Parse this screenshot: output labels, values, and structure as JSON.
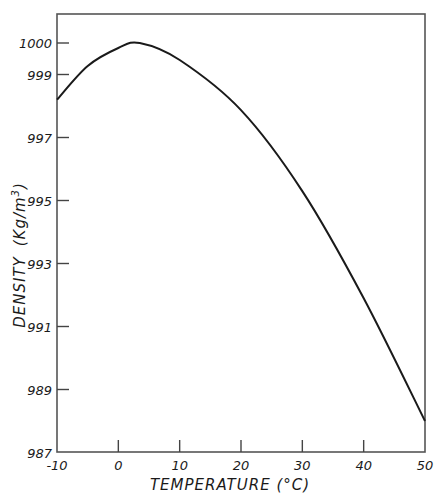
{
  "chart_data": {
    "type": "line",
    "title": "",
    "xlabel": "TEMPERATURE (°C)",
    "ylabel": "DENSITY (Kg/m3)",
    "ylabel_parts": {
      "main": "DENSITY",
      "unit": "(Kg/m",
      "sup": "3",
      "close": ")"
    },
    "xlim": [
      -10,
      50
    ],
    "ylim": [
      987,
      1001.3
    ],
    "x_ticks": [
      -10,
      0,
      10,
      20,
      30,
      40,
      50
    ],
    "x_tick_labels": [
      "-10",
      "0",
      "10",
      "20",
      "30",
      "40",
      "50"
    ],
    "y_ticks": [
      987,
      989,
      991,
      993,
      995,
      997,
      999,
      1000
    ],
    "y_tick_labels": [
      "987",
      "989",
      "991",
      "993",
      "995",
      "997",
      "999",
      "1000"
    ],
    "grid": false,
    "legend": null,
    "series": [
      {
        "name": "Water density",
        "x": [
          -10,
          -5,
          0,
          3.5,
          10,
          20,
          30,
          40,
          50
        ],
        "y": [
          998.2,
          999.27,
          999.84,
          1000.0,
          999.46,
          997.87,
          995.3,
          991.9,
          988.0
        ]
      }
    ],
    "colors": {
      "line": "#1a1a1a",
      "axis": "#555555",
      "background": "#ffffff"
    }
  }
}
